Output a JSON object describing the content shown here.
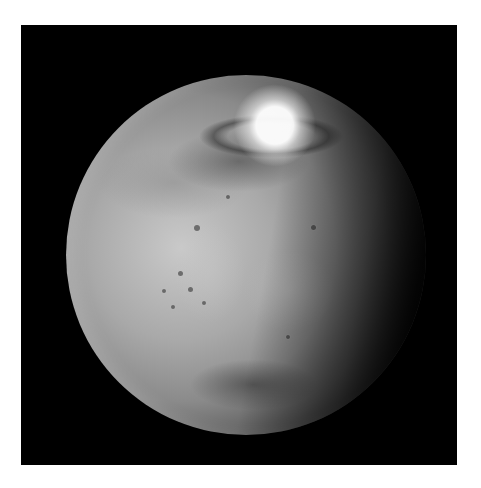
{
  "image": {
    "subject": "Mars",
    "description": "Grayscale photograph of the planet Mars against black space, showing the north polar ice cap at top, cratered terrain and a dark albedo region in the lower half, with the terminator shading toward the right.",
    "features": {
      "polar_cap": "north-polar-ice-cap",
      "dark_region": "dark-albedo-feature",
      "craters": "crater-field"
    },
    "colors": {
      "border": "#ffffff",
      "background": "#000000",
      "planet_highlight": "#c9c9c9",
      "planet_shadow": "#080808"
    }
  }
}
